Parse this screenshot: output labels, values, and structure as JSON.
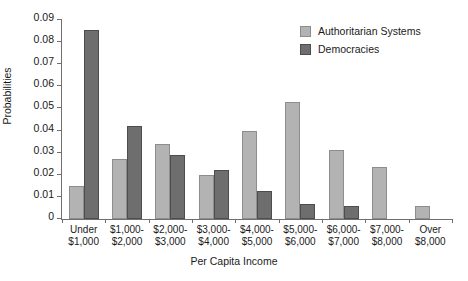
{
  "chart_data": {
    "type": "bar",
    "title": "",
    "xlabel": "Per Capita Income",
    "ylabel": "Probabilities",
    "ylim": [
      0,
      0.09
    ],
    "ytick_values": [
      0,
      0.01,
      0.02,
      0.03,
      0.04,
      0.05,
      0.06,
      0.07,
      0.08,
      0.09
    ],
    "ytick_labels": [
      "0",
      "0.01",
      "0.02",
      "0.03",
      "0.04",
      "0.05",
      "0.06",
      "0.07",
      "0.08",
      "0.09"
    ],
    "grid": false,
    "legend_position": "top-right",
    "categories": [
      {
        "line1": "Under",
        "line2": "$1,000"
      },
      {
        "line1": "$1,000-",
        "line2": "$2,000"
      },
      {
        "line1": "$2,000-",
        "line2": "$3,000"
      },
      {
        "line1": "$3,000-",
        "line2": "$4,000"
      },
      {
        "line1": "$4,000-",
        "line2": "$5,000"
      },
      {
        "line1": "$5,000-",
        "line2": "$6,000"
      },
      {
        "line1": "$6,000-",
        "line2": "$7,000"
      },
      {
        "line1": "$7,000-",
        "line2": "$8,000"
      },
      {
        "line1": "Over",
        "line2": "$8,000"
      }
    ],
    "series": [
      {
        "name": "Authoritarian Systems",
        "color": "#b3b3b3",
        "values": [
          0.015,
          0.027,
          0.034,
          0.02,
          0.04,
          0.053,
          0.031,
          0.0235,
          0.006
        ]
      },
      {
        "name": "Democracies",
        "color": "#6e6e6e",
        "values": [
          0.0855,
          0.042,
          0.029,
          0.022,
          0.0125,
          0.007,
          0.006,
          0,
          0
        ]
      }
    ]
  },
  "caption": ""
}
